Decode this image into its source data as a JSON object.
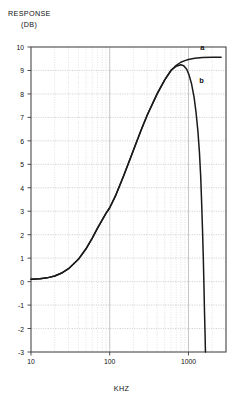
{
  "chart_data": {
    "type": "line",
    "title": "",
    "ylabel": "RESPONSE (DB)",
    "ylabel_line1": "RESPONSE",
    "ylabel_line2": "(DB)",
    "xlabel": "KHZ",
    "xscale": "log",
    "yscale": "linear",
    "xlim": [
      10,
      3000
    ],
    "ylim": [
      -3,
      10
    ],
    "grid": true,
    "grid_major_color": "#b5b5b5",
    "grid_minor_color": "#c9c9c9",
    "curve_color": "#1a1a1a",
    "legend_position": "inline-annotation",
    "ytick_labels": [
      "10",
      "9",
      "8",
      "7",
      "6",
      "5",
      "4",
      "3",
      "2",
      "1",
      "0",
      "-1",
      "-2",
      "-3"
    ],
    "ytick_values": [
      10,
      9,
      8,
      7,
      6,
      5,
      4,
      3,
      2,
      1,
      0,
      -1,
      -2,
      -3
    ],
    "xtick_labels": [
      "10",
      "100",
      "1000"
    ],
    "xtick_values": [
      10,
      100,
      1000
    ],
    "annotations": [
      {
        "text": "a",
        "x": 1500,
        "y": 9.95
      },
      {
        "text": "b",
        "x": 1450,
        "y": 8.55
      }
    ],
    "series": [
      {
        "name": "a",
        "label": "a",
        "points": [
          [
            10,
            0.1
          ],
          [
            13,
            0.12
          ],
          [
            16,
            0.16
          ],
          [
            20,
            0.24
          ],
          [
            25,
            0.38
          ],
          [
            30,
            0.55
          ],
          [
            40,
            0.95
          ],
          [
            50,
            1.4
          ],
          [
            60,
            1.85
          ],
          [
            70,
            2.28
          ],
          [
            80,
            2.62
          ],
          [
            90,
            2.92
          ],
          [
            100,
            3.15
          ],
          [
            120,
            3.7
          ],
          [
            150,
            4.5
          ],
          [
            200,
            5.6
          ],
          [
            250,
            6.45
          ],
          [
            300,
            7.1
          ],
          [
            400,
            8.0
          ],
          [
            500,
            8.6
          ],
          [
            600,
            9.0
          ],
          [
            700,
            9.22
          ],
          [
            800,
            9.35
          ],
          [
            900,
            9.42
          ],
          [
            1000,
            9.47
          ],
          [
            1200,
            9.52
          ],
          [
            1500,
            9.55
          ],
          [
            2000,
            9.56
          ],
          [
            2600,
            9.56
          ]
        ]
      },
      {
        "name": "b",
        "label": "b",
        "points": [
          [
            10,
            0.1
          ],
          [
            13,
            0.12
          ],
          [
            16,
            0.16
          ],
          [
            20,
            0.24
          ],
          [
            25,
            0.38
          ],
          [
            30,
            0.55
          ],
          [
            40,
            0.95
          ],
          [
            50,
            1.4
          ],
          [
            60,
            1.85
          ],
          [
            70,
            2.28
          ],
          [
            80,
            2.62
          ],
          [
            90,
            2.92
          ],
          [
            100,
            3.15
          ],
          [
            120,
            3.7
          ],
          [
            150,
            4.5
          ],
          [
            200,
            5.6
          ],
          [
            250,
            6.45
          ],
          [
            300,
            7.1
          ],
          [
            400,
            8.0
          ],
          [
            500,
            8.6
          ],
          [
            600,
            9.0
          ],
          [
            700,
            9.18
          ],
          [
            800,
            9.24
          ],
          [
            870,
            9.2
          ],
          [
            950,
            9.05
          ],
          [
            1020,
            8.8
          ],
          [
            1100,
            8.4
          ],
          [
            1180,
            7.85
          ],
          [
            1250,
            7.2
          ],
          [
            1320,
            6.4
          ],
          [
            1380,
            5.5
          ],
          [
            1430,
            4.5
          ],
          [
            1470,
            3.4
          ],
          [
            1510,
            2.2
          ],
          [
            1545,
            1.0
          ],
          [
            1575,
            -0.2
          ],
          [
            1600,
            -1.3
          ],
          [
            1625,
            -2.2
          ],
          [
            1645,
            -3.0
          ]
        ]
      }
    ]
  }
}
